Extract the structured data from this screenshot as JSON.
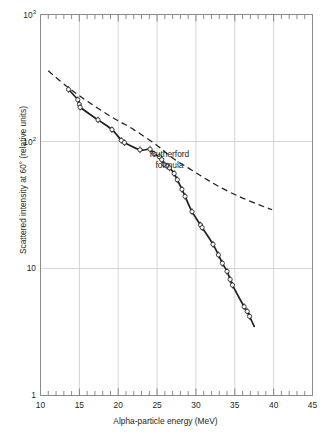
{
  "chart_data": {
    "type": "line",
    "title": "",
    "xlabel": "Alpha-particle energy (MeV)",
    "ylabel": "Scattered intensity at 60° (relative units)",
    "xlim": [
      10,
      45
    ],
    "ylim": [
      1,
      1000
    ],
    "yscale": "log",
    "xscale": "linear",
    "grid": true,
    "x_major_ticks": [
      10,
      15,
      20,
      25,
      30,
      35,
      40,
      45
    ],
    "x_major_tick_labels": [
      "10",
      "15",
      "20",
      "25",
      "30",
      "35",
      "40",
      "45"
    ],
    "x_minor_tick_step": 1,
    "y_major_ticks": [
      1,
      10,
      100,
      1000
    ],
    "y_major_tick_labels": [
      "1",
      "10",
      "10²",
      "10³"
    ],
    "annotations": [
      {
        "name": "rutherford-formula-label",
        "text_line1": "Rutherford",
        "text_line2": "formula",
        "x": 26.6,
        "y": 78
      }
    ],
    "series": [
      {
        "name": "Measured scattered intensity",
        "style": "solid-curve-with-open-circle-markers-and-error-bars",
        "marker": "open-circle",
        "color": "#231f20",
        "points": [
          {
            "x": 13.6,
            "y": 257
          },
          {
            "x": 14.8,
            "y": 213
          },
          {
            "x": 15.0,
            "y": 196
          },
          {
            "x": 15.1,
            "y": 186
          },
          {
            "x": 17.4,
            "y": 148
          },
          {
            "x": 19.2,
            "y": 124
          },
          {
            "x": 20.4,
            "y": 102
          },
          {
            "x": 20.8,
            "y": 98
          },
          {
            "x": 22.8,
            "y": 86
          },
          {
            "x": 24.1,
            "y": 87
          },
          {
            "x": 24.6,
            "y": 80
          },
          {
            "x": 25.3,
            "y": 76
          },
          {
            "x": 25.6,
            "y": 72
          },
          {
            "x": 25.9,
            "y": 66
          },
          {
            "x": 26.3,
            "y": 64
          },
          {
            "x": 26.6,
            "y": 62
          },
          {
            "x": 27.2,
            "y": 56
          },
          {
            "x": 27.6,
            "y": 50
          },
          {
            "x": 28.2,
            "y": 42
          },
          {
            "x": 28.6,
            "y": 37
          },
          {
            "x": 29.5,
            "y": 28
          },
          {
            "x": 30.6,
            "y": 22
          },
          {
            "x": 30.8,
            "y": 21
          },
          {
            "x": 32.2,
            "y": 15.5
          },
          {
            "x": 32.9,
            "y": 12.8
          },
          {
            "x": 33.4,
            "y": 11.0
          },
          {
            "x": 34.0,
            "y": 9.5
          },
          {
            "x": 34.4,
            "y": 8.2
          },
          {
            "x": 34.7,
            "y": 7.4
          },
          {
            "x": 36.2,
            "y": 5.0
          },
          {
            "x": 36.6,
            "y": 4.6
          },
          {
            "x": 36.9,
            "y": 4.2
          }
        ]
      },
      {
        "name": "Rutherford formula",
        "style": "dashed-line",
        "color": "#231f20",
        "points": [
          {
            "x": 11.0,
            "y": 360
          },
          {
            "x": 13.5,
            "y": 268
          },
          {
            "x": 16.0,
            "y": 208
          },
          {
            "x": 19.0,
            "y": 158
          },
          {
            "x": 22.0,
            "y": 124
          },
          {
            "x": 25.0,
            "y": 93
          },
          {
            "x": 27.0,
            "y": 74
          },
          {
            "x": 29.0,
            "y": 62
          },
          {
            "x": 31.0,
            "y": 52
          },
          {
            "x": 33.0,
            "y": 44
          },
          {
            "x": 35.5,
            "y": 37
          },
          {
            "x": 38.0,
            "y": 32
          },
          {
            "x": 39.8,
            "y": 29
          }
        ]
      }
    ]
  }
}
